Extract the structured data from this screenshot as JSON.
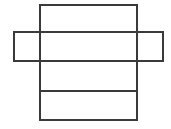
{
  "figure": {
    "name": "box-net-diagram",
    "type": "geometric-net",
    "canvas": {
      "width": 171,
      "height": 129
    },
    "background_color": "#ffffff",
    "line_color": "#3a3a3a",
    "line_width": 1.6,
    "shapes": {
      "vertical_strip": {
        "label": "vertical-strip",
        "x": 40,
        "y": 5,
        "width": 97,
        "height": 115
      },
      "horizontal_strip": {
        "label": "horizontal-strip",
        "x": 14,
        "y": 32,
        "width": 149,
        "height": 29
      }
    },
    "fold_lines": [
      {
        "label": "fold-line-1",
        "x1": 40,
        "y1": 32,
        "x2": 137,
        "y2": 32
      },
      {
        "label": "fold-line-2",
        "x1": 40,
        "y1": 61,
        "x2": 137,
        "y2": 61
      },
      {
        "label": "fold-line-3",
        "x1": 40,
        "y1": 91,
        "x2": 137,
        "y2": 91
      }
    ],
    "side_fold_lines": [
      {
        "label": "left-fold-line",
        "x1": 40,
        "y1": 32,
        "x2": 40,
        "y2": 61
      },
      {
        "label": "right-fold-line",
        "x1": 137,
        "y1": 32,
        "x2": 137,
        "y2": 61
      }
    ],
    "panels": [
      {
        "label": "top-panel",
        "x": 40,
        "y": 5,
        "width": 97,
        "height": 27
      },
      {
        "label": "center-panel",
        "x": 40,
        "y": 32,
        "width": 97,
        "height": 29
      },
      {
        "label": "third-panel",
        "x": 40,
        "y": 61,
        "width": 97,
        "height": 30
      },
      {
        "label": "bottom-panel",
        "x": 40,
        "y": 91,
        "width": 97,
        "height": 29
      },
      {
        "label": "left-flap",
        "x": 14,
        "y": 32,
        "width": 26,
        "height": 29
      },
      {
        "label": "right-flap",
        "x": 137,
        "y": 32,
        "width": 26,
        "height": 29
      }
    ],
    "labels": []
  }
}
